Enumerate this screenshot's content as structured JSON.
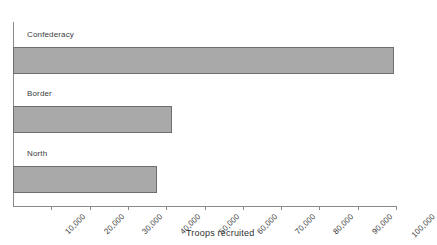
{
  "chart_data": {
    "type": "bar",
    "orientation": "horizontal",
    "title": "",
    "subtitle": "",
    "xlabel": "Troops recruited",
    "ylabel": "",
    "categories": [
      "Confederacy",
      "Border",
      "North"
    ],
    "values": [
      99500,
      41500,
      37600
    ],
    "series": [
      {
        "name": "Troops recruited",
        "values": [
          99500,
          41500,
          37600
        ]
      }
    ],
    "xlim": [
      0,
      100000
    ],
    "xticks": [
      10000,
      20000,
      30000,
      40000,
      50000,
      60000,
      70000,
      80000,
      90000,
      100000
    ],
    "xticklabels": [
      "10,000",
      "20,000",
      "30,000",
      "40,000",
      "50,000",
      "60,000",
      "70,000",
      "80,000",
      "90,000",
      "100,000"
    ],
    "xtick_rotation": -45,
    "grid": false,
    "legend": false,
    "legend_position": "none",
    "bar_fill_color": "#a9a9a9",
    "bar_edge_color": "#6e6e6e",
    "axis_color": "#8a8a8a",
    "text_color": "#3c3c3c",
    "background_color": "#ffffff",
    "annotations": []
  },
  "axes": {
    "x_axis_title": "Troops recruited"
  },
  "bars": [
    {
      "label": "Confederacy",
      "value": 99500,
      "value_label": ""
    },
    {
      "label": "Border",
      "value": 41500,
      "value_label": ""
    },
    {
      "label": "North",
      "value": 37600,
      "value_label": ""
    }
  ],
  "ticks": [
    {
      "label": "10,000",
      "value": 10000
    },
    {
      "label": "20,000",
      "value": 20000
    },
    {
      "label": "30,000",
      "value": 30000
    },
    {
      "label": "40,000",
      "value": 40000
    },
    {
      "label": "50,000",
      "value": 50000
    },
    {
      "label": "60,000",
      "value": 60000
    },
    {
      "label": "70,000",
      "value": 70000
    },
    {
      "label": "80,000",
      "value": 80000
    },
    {
      "label": "90,000",
      "value": 90000
    },
    {
      "label": "100,000",
      "value": 100000
    }
  ]
}
